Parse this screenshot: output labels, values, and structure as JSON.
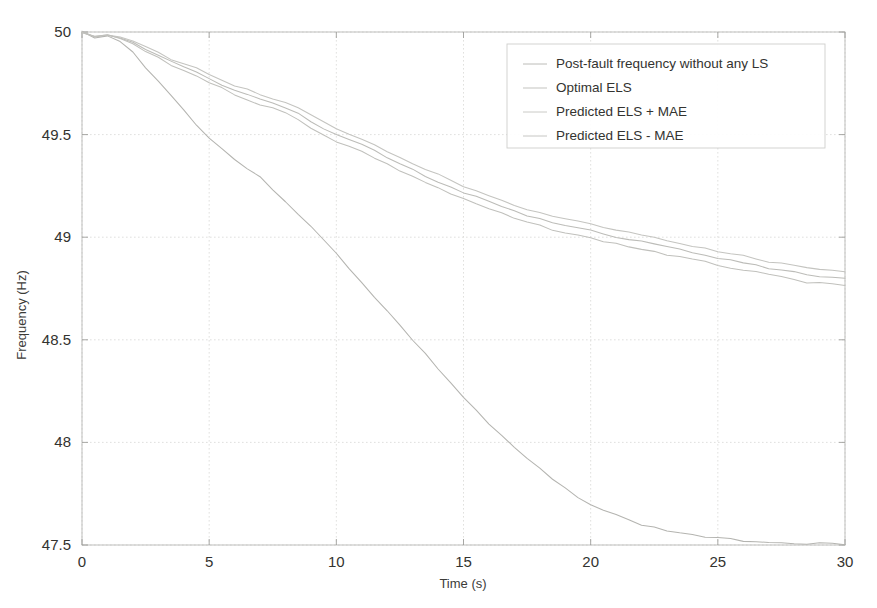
{
  "chart_data": {
    "type": "line",
    "title": "",
    "xlabel": "Time (s)",
    "ylabel": "Frequency (Hz)",
    "xlim": [
      0,
      30
    ],
    "ylim": [
      47.5,
      50
    ],
    "xticks": [
      "0",
      "5",
      "10",
      "15",
      "20",
      "25",
      "30"
    ],
    "xtick_values": [
      0,
      5,
      10,
      15,
      20,
      25,
      30
    ],
    "yticks": [
      "47.5",
      "48",
      "48.5",
      "49",
      "49.5",
      "50"
    ],
    "ytick_values": [
      47.5,
      48,
      48.5,
      49,
      49.5,
      50
    ],
    "grid": true,
    "legend_position": "top-right",
    "x": [
      0,
      0.5,
      1,
      1.5,
      2,
      2.5,
      3,
      3.5,
      4,
      4.5,
      5,
      5.5,
      6,
      6.5,
      7,
      7.5,
      8,
      8.5,
      9,
      9.5,
      10,
      10.5,
      11,
      11.5,
      12,
      12.5,
      13,
      13.5,
      14,
      14.5,
      15,
      15.5,
      16,
      16.5,
      17,
      17.5,
      18,
      18.5,
      19,
      19.5,
      20,
      20.5,
      21,
      21.5,
      22,
      22.5,
      23,
      23.5,
      24,
      24.5,
      25,
      25.5,
      26,
      26.5,
      27,
      27.5,
      28,
      28.5,
      29,
      29.5,
      30
    ],
    "series": [
      {
        "name": "Post-fault frequency without any LS",
        "color": "#b4b4b0",
        "values": [
          50.0,
          49.975,
          49.98,
          49.955,
          49.9,
          49.83,
          49.76,
          49.69,
          49.62,
          49.55,
          49.485,
          49.43,
          49.38,
          49.335,
          49.29,
          49.235,
          49.175,
          49.115,
          49.05,
          48.985,
          48.92,
          48.85,
          48.78,
          48.71,
          48.64,
          48.57,
          48.5,
          48.43,
          48.36,
          48.29,
          48.22,
          48.155,
          48.09,
          48.03,
          47.975,
          47.92,
          47.87,
          47.82,
          47.775,
          47.735,
          47.7,
          47.67,
          47.645,
          47.62,
          47.6,
          47.585,
          47.57,
          47.56,
          47.55,
          47.54,
          47.532,
          47.527,
          47.522,
          47.518,
          47.515,
          47.512,
          47.51,
          47.508,
          47.507,
          47.506,
          47.505
        ]
      },
      {
        "name": "Optimal ELS",
        "color": "#bcbcb8",
        "values": [
          50.0,
          49.978,
          49.985,
          49.972,
          49.948,
          49.915,
          49.885,
          49.855,
          49.83,
          49.805,
          49.775,
          49.745,
          49.718,
          49.695,
          49.672,
          49.652,
          49.63,
          49.6,
          49.565,
          49.53,
          49.5,
          49.475,
          49.45,
          49.42,
          49.388,
          49.358,
          49.33,
          49.3,
          49.272,
          49.245,
          49.218,
          49.195,
          49.172,
          49.148,
          49.125,
          49.105,
          49.09,
          49.072,
          49.055,
          49.042,
          49.03,
          49.018,
          49.002,
          48.99,
          48.978,
          48.965,
          48.95,
          48.938,
          48.925,
          48.912,
          48.9,
          48.888,
          48.875,
          48.862,
          48.85,
          48.84,
          48.828,
          48.818,
          48.81,
          48.802,
          48.795
        ]
      },
      {
        "name": "Predicted ELS + MAE",
        "color": "#c4c4c0",
        "values": [
          50.0,
          49.98,
          49.988,
          49.976,
          49.955,
          49.925,
          49.898,
          49.87,
          49.845,
          49.822,
          49.795,
          49.765,
          49.74,
          49.718,
          49.696,
          49.676,
          49.656,
          49.628,
          49.595,
          49.56,
          49.53,
          49.505,
          49.48,
          49.45,
          49.42,
          49.39,
          49.362,
          49.332,
          49.305,
          49.278,
          49.25,
          49.228,
          49.205,
          49.182,
          49.158,
          49.138,
          49.122,
          49.105,
          49.09,
          49.075,
          49.062,
          49.05,
          49.035,
          49.022,
          49.01,
          48.998,
          48.982,
          48.97,
          48.958,
          48.945,
          48.932,
          48.92,
          48.908,
          48.895,
          48.882,
          48.872,
          48.86,
          48.85,
          48.842,
          48.835,
          48.828
        ]
      },
      {
        "name": "Predicted ELS - MAE",
        "color": "#c0c0bc",
        "values": [
          50.0,
          49.976,
          49.982,
          49.968,
          49.942,
          49.905,
          49.872,
          49.84,
          49.812,
          49.788,
          49.755,
          49.725,
          49.698,
          49.672,
          49.648,
          49.628,
          49.605,
          49.572,
          49.535,
          49.5,
          49.468,
          49.442,
          49.418,
          49.388,
          49.355,
          49.325,
          49.298,
          49.268,
          49.24,
          49.212,
          49.185,
          49.162,
          49.138,
          49.115,
          49.092,
          49.072,
          49.055,
          49.038,
          49.022,
          49.008,
          48.995,
          48.982,
          48.968,
          48.955,
          48.942,
          48.93,
          48.915,
          48.902,
          48.89,
          48.878,
          48.865,
          48.852,
          48.84,
          48.828,
          48.815,
          48.805,
          48.792,
          48.782,
          48.775,
          48.768,
          48.762
        ]
      }
    ]
  },
  "legend": {
    "items": [
      {
        "label": "Post-fault frequency without any LS",
        "color": "#b4b4b0"
      },
      {
        "label": "Optimal ELS",
        "color": "#bcbcb8"
      },
      {
        "label": "Predicted ELS + MAE",
        "color": "#c4c4c0"
      },
      {
        "label": "Predicted ELS - MAE",
        "color": "#c0c0bc"
      }
    ]
  },
  "axes": {
    "x_title": "Time (s)",
    "y_title": "Frequency (Hz)"
  }
}
